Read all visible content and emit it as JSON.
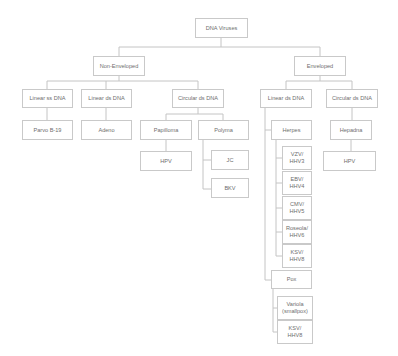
{
  "diagram": {
    "title": "DNA Viruses",
    "nodes": {
      "root": "DNA Viruses",
      "non_enveloped": "Non-Enveloped",
      "enveloped": "Enveloped",
      "ne_linear_ss": "Linear ss DNA",
      "ne_linear_ds": "Linear ds DNA",
      "ne_circular_ds": "Circular ds DNA",
      "e_linear_ds": "Linear ds DNA",
      "e_circular_ds": "Circular ds DNA",
      "parvo": "Parvo B-19",
      "adeno": "Adeno",
      "papilloma": "Papilloma",
      "polyma": "Polyma",
      "hpv_papilloma": "HPV",
      "jc": "JC",
      "bkv": "BKV",
      "herpes": "Herpes",
      "vzv": "VZV/\nHHV3",
      "ebv": "EBV/\nHHV4",
      "cmv": "CMV/\nHHV5",
      "roseola": "Roseola/\nHHV6",
      "ksv_herpes": "KSV/\nHHV8",
      "pox": "Pox",
      "variola": "Variola\n(smallpox)",
      "ksv_pox": "KSV/\nHHV8",
      "hepadna": "Hepadna",
      "hpv_hepadna": "HPV"
    },
    "edges": [
      [
        "root",
        "non_enveloped"
      ],
      [
        "root",
        "enveloped"
      ],
      [
        "non_enveloped",
        "ne_linear_ss"
      ],
      [
        "non_enveloped",
        "ne_linear_ds"
      ],
      [
        "non_enveloped",
        "ne_circular_ds"
      ],
      [
        "enveloped",
        "e_linear_ds"
      ],
      [
        "enveloped",
        "e_circular_ds"
      ],
      [
        "ne_linear_ss",
        "parvo"
      ],
      [
        "ne_linear_ds",
        "adeno"
      ],
      [
        "ne_circular_ds",
        "papilloma"
      ],
      [
        "ne_circular_ds",
        "polyma"
      ],
      [
        "papilloma",
        "hpv_papilloma"
      ],
      [
        "polyma",
        "jc"
      ],
      [
        "polyma",
        "bkv"
      ],
      [
        "e_linear_ds",
        "herpes"
      ],
      [
        "e_linear_ds",
        "pox"
      ],
      [
        "herpes",
        "vzv"
      ],
      [
        "herpes",
        "ebv"
      ],
      [
        "herpes",
        "cmv"
      ],
      [
        "herpes",
        "roseola"
      ],
      [
        "herpes",
        "ksv_herpes"
      ],
      [
        "pox",
        "variola"
      ],
      [
        "pox",
        "ksv_pox"
      ],
      [
        "e_circular_ds",
        "hepadna"
      ],
      [
        "hepadna",
        "hpv_hepadna"
      ]
    ],
    "colors": {
      "border": "#c9c9c9",
      "line": "#c4c4c4",
      "text": "#6e6e6e",
      "background": "#ffffff"
    }
  }
}
